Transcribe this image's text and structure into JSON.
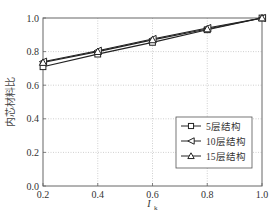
{
  "chart_data": {
    "type": "line",
    "title": "",
    "xlabel": "I_k",
    "xlabel_main": "I",
    "xlabel_sub": "k",
    "ylabel": "内芯材料比",
    "x": [
      0.2,
      0.4,
      0.6,
      0.8,
      1.0
    ],
    "xlim": [
      0.2,
      1.0
    ],
    "ylim": [
      0.0,
      1.0
    ],
    "xticks": [
      "0.2",
      "0.4",
      "0.6",
      "0.8",
      "1.0"
    ],
    "yticks": [
      "0.0",
      "0.2",
      "0.4",
      "0.6",
      "0.8",
      "1.0"
    ],
    "grid": true,
    "legend_position": "lower right",
    "series": [
      {
        "name": "5层结构",
        "marker": "square",
        "values": [
          0.71,
          0.785,
          0.855,
          0.93,
          1.0
        ]
      },
      {
        "name": "10层结构",
        "marker": "triangle-left",
        "values": [
          0.74,
          0.805,
          0.875,
          0.94,
          1.0
        ]
      },
      {
        "name": "15层结构",
        "marker": "triangle-up",
        "values": [
          0.735,
          0.8,
          0.87,
          0.935,
          1.0
        ]
      }
    ]
  },
  "colors": {
    "line": "#222222",
    "grid": "#bbbbbb",
    "axis": "#555555"
  }
}
